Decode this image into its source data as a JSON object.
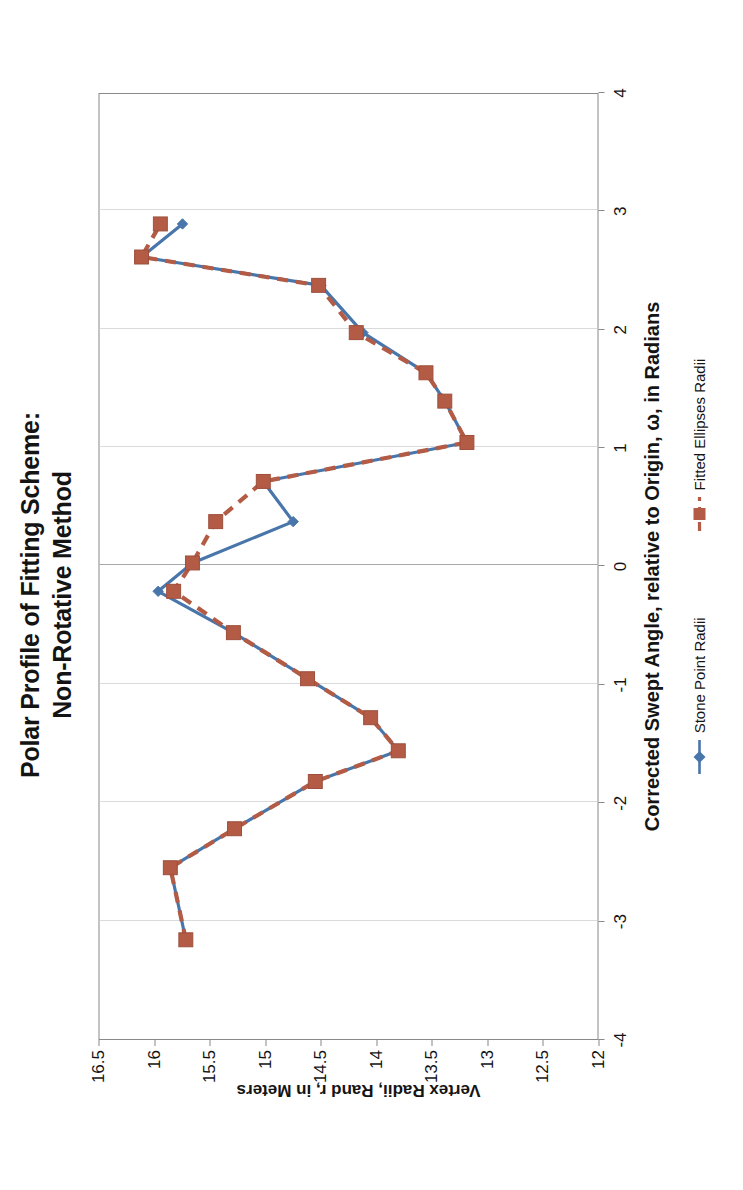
{
  "chart_data": {
    "type": "line",
    "title": "Polar Profile of Fitting Scheme:",
    "title_line2": "Non-Rotative Method",
    "xlabel": "Corrected Swept Angle, relative to Origin, ω, in Radians",
    "ylabel": "Vertex Radii, Rand r, in Meters",
    "xlim": [
      -4,
      4
    ],
    "ylim": [
      12,
      16.5
    ],
    "xticks": [
      "-4",
      "-3",
      "-2",
      "-1",
      "0",
      "1",
      "2",
      "3",
      "4"
    ],
    "xtick_values": [
      -4,
      -3,
      -2,
      -1,
      0,
      1,
      2,
      3,
      4
    ],
    "yticks": [
      "16.5",
      "16",
      "15.5",
      "15",
      "14.5",
      "14",
      "13.5",
      "13",
      "12.5",
      "12"
    ],
    "ytick_values": [
      16.5,
      16,
      15.5,
      15,
      14.5,
      14,
      13.5,
      13,
      12.5,
      12
    ],
    "grid": true,
    "legend_position": "bottom",
    "series": [
      {
        "name": "Stone Point Radii",
        "color": "#4472a8",
        "marker": "diamond",
        "linestyle": "solid",
        "x": [
          -3.16,
          -2.55,
          -2.22,
          -1.82,
          -1.56,
          -1.28,
          -0.95,
          -0.56,
          -0.21,
          0.03,
          0.38,
          0.72,
          1.05,
          1.4,
          1.64,
          1.98,
          2.38,
          2.62,
          2.9
        ],
        "y": [
          15.72,
          15.86,
          15.28,
          14.55,
          13.8,
          14.05,
          14.62,
          15.29,
          15.97,
          15.66,
          14.75,
          15.02,
          13.18,
          13.38,
          13.55,
          14.12,
          14.5,
          16.12,
          15.75
        ]
      },
      {
        "name": "Fitted Ellipses Radii",
        "color": "#b1563f",
        "marker": "square",
        "linestyle": "dashed",
        "x": [
          -3.16,
          -2.55,
          -2.22,
          -1.82,
          -1.56,
          -1.28,
          -0.95,
          -0.56,
          -0.21,
          0.03,
          0.38,
          0.72,
          1.05,
          1.4,
          1.64,
          1.98,
          2.38,
          2.62,
          2.9
        ],
        "y": [
          15.72,
          15.86,
          15.28,
          14.55,
          13.8,
          14.05,
          14.62,
          15.29,
          15.83,
          15.66,
          15.45,
          15.02,
          13.18,
          13.38,
          13.55,
          14.18,
          14.52,
          16.12,
          15.95
        ]
      }
    ]
  },
  "legend": {
    "items": [
      {
        "label": "Stone Point Radii",
        "color": "#4472a8",
        "marker": "diamond"
      },
      {
        "label": "Fitted Ellipses Radii",
        "color": "#b1563f",
        "marker": "square"
      }
    ]
  }
}
